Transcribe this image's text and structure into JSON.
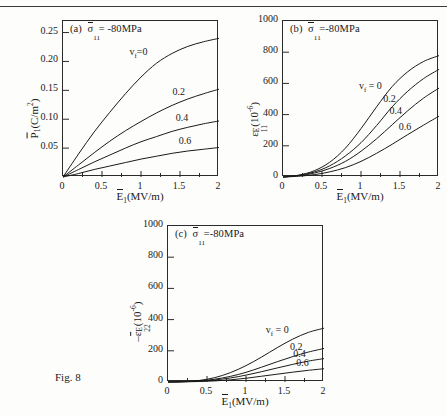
{
  "figure": {
    "caption": "Fig. 8",
    "xlabel_main": "E",
    "xlabel_sub": "1",
    "xlabel_units": "(MV/m)"
  },
  "common": {
    "stress_symbol": "σ",
    "stress_sub": "11",
    "stress_value": "-80MPa",
    "series_param": "v",
    "series_param_sub": "f",
    "series_labels": [
      "0",
      "0.2",
      "0.4",
      "0.6"
    ],
    "series_lead_label": "v_f = 0"
  },
  "chart_data": [
    {
      "type": "line",
      "panel": "a",
      "title": "(a)  σ̄11= -80MPa",
      "title_prefix": "(a)",
      "title_eq": "= -80MPa",
      "xlabel": "Ē1(MV/m)",
      "ylabel": "P̄1(C/m2)",
      "ylabel_main": "P",
      "ylabel_sub": "1",
      "ylabel_units": "(C/m",
      "ylabel_units_sup": "2",
      "ylabel_units_tail": ")",
      "xlim": [
        0,
        2
      ],
      "ylim": [
        0,
        0.27
      ],
      "xticks": [
        0,
        0.5,
        1,
        1.5,
        2
      ],
      "xticklabels": [
        "0",
        "0.5",
        "1",
        "1.5",
        "2"
      ],
      "yticks": [
        0.05,
        0.1,
        0.15,
        0.2,
        0.25
      ],
      "yticklabels": [
        "0.05",
        "0.10",
        "0.15",
        "0.20",
        "0.25"
      ],
      "grid": false,
      "x": [
        0,
        0.2,
        0.4,
        0.6,
        0.8,
        1.0,
        1.2,
        1.4,
        1.6,
        1.8,
        2.0
      ],
      "series": [
        {
          "name": "0",
          "values": [
            0,
            0.04,
            0.078,
            0.112,
            0.144,
            0.173,
            0.197,
            0.214,
            0.226,
            0.234,
            0.24
          ]
        },
        {
          "name": "0.2",
          "values": [
            0,
            0.021,
            0.042,
            0.062,
            0.08,
            0.096,
            0.111,
            0.124,
            0.135,
            0.144,
            0.152
          ]
        },
        {
          "name": "0.4",
          "values": [
            0,
            0.013,
            0.026,
            0.038,
            0.05,
            0.061,
            0.07,
            0.079,
            0.086,
            0.092,
            0.097
          ]
        },
        {
          "name": "0.6",
          "values": [
            0,
            0.006,
            0.013,
            0.019,
            0.025,
            0.031,
            0.036,
            0.041,
            0.045,
            0.048,
            0.051
          ]
        }
      ],
      "curve_label_positions": [
        "0",
        "0.2",
        "0.4",
        "0.6"
      ]
    },
    {
      "type": "line",
      "panel": "b",
      "title": "(b)  σ̄11=-80MPa",
      "title_prefix": "(b)",
      "title_eq": "=-80MPa",
      "xlabel": "Ē1(MV/m)",
      "ylabel": "ε11E (10-6)",
      "ylabel_main": "ε",
      "ylabel_sub": "11",
      "ylabel_sup": "E",
      "ylabel_units": "(10",
      "ylabel_units_sup": "-6",
      "ylabel_units_tail": ")",
      "xlim": [
        0,
        2
      ],
      "ylim": [
        0,
        1000
      ],
      "xticks": [
        0,
        0.5,
        1,
        1.5,
        2
      ],
      "xticklabels": [
        "0",
        "0.5",
        "1",
        "1.5",
        "2"
      ],
      "yticks": [
        0,
        200,
        400,
        600,
        800,
        1000
      ],
      "yticklabels": [
        "0",
        "200",
        "400",
        "600",
        "800",
        "1000"
      ],
      "grid": false,
      "x": [
        0,
        0.2,
        0.4,
        0.6,
        0.8,
        1.0,
        1.2,
        1.4,
        1.6,
        1.8,
        2.0
      ],
      "series": [
        {
          "name": "0",
          "values": [
            0,
            12,
            40,
            95,
            185,
            310,
            450,
            580,
            675,
            740,
            778
          ]
        },
        {
          "name": "0.2",
          "values": [
            0,
            10,
            32,
            72,
            135,
            220,
            330,
            450,
            550,
            630,
            690
          ]
        },
        {
          "name": "0.4",
          "values": [
            0,
            8,
            25,
            55,
            100,
            165,
            245,
            335,
            425,
            505,
            570
          ]
        },
        {
          "name": "0.6",
          "values": [
            0,
            5,
            15,
            33,
            60,
            100,
            152,
            210,
            272,
            332,
            390
          ]
        }
      ],
      "curve_label_positions": [
        "0",
        "0.2",
        "0.4",
        "0.6"
      ]
    },
    {
      "type": "line",
      "panel": "c",
      "title": "(c)  σ̄11=-80MPa",
      "title_prefix": "(c)",
      "title_eq": "=-80MPa",
      "xlabel": "Ē1(MV/m)",
      "ylabel": "-ε̄22E (10-6)",
      "ylabel_main": "-ε",
      "ylabel_sub": "22",
      "ylabel_sup": "E",
      "ylabel_units": "(10",
      "ylabel_units_sup": "-6",
      "ylabel_units_tail": ")",
      "xlim": [
        0,
        2
      ],
      "ylim": [
        0,
        1000
      ],
      "xticks": [
        0,
        0.5,
        1,
        1.5,
        2
      ],
      "xticklabels": [
        "0",
        "0.5",
        "1",
        "1.5",
        "2"
      ],
      "yticks": [
        0,
        200,
        400,
        600,
        800,
        1000
      ],
      "yticklabels": [
        "0",
        "200",
        "400",
        "600",
        "800",
        "1000"
      ],
      "grid": false,
      "x": [
        0,
        0.2,
        0.4,
        0.6,
        0.8,
        1.0,
        1.2,
        1.4,
        1.6,
        1.8,
        2.0
      ],
      "series": [
        {
          "name": "0",
          "values": [
            0,
            3,
            10,
            28,
            60,
            105,
            160,
            220,
            275,
            318,
            345
          ]
        },
        {
          "name": "0.2",
          "values": [
            0,
            2,
            7,
            18,
            36,
            62,
            95,
            130,
            163,
            192,
            215
          ]
        },
        {
          "name": "0.4",
          "values": [
            0,
            2,
            5,
            13,
            26,
            44,
            66,
            90,
            113,
            134,
            150
          ]
        },
        {
          "name": "0.6",
          "values": [
            0,
            1,
            3,
            7,
            14,
            24,
            37,
            50,
            63,
            75,
            85
          ]
        }
      ],
      "curve_label_positions": [
        "0",
        "0.2",
        "0.4",
        "0.6"
      ]
    }
  ]
}
